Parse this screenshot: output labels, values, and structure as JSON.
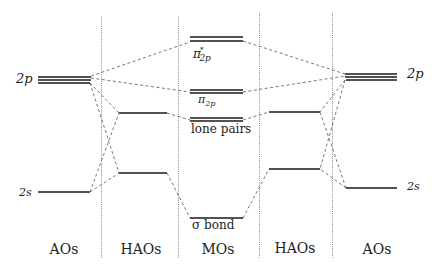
{
  "diagram": {
    "columns": [
      {
        "label": "AOs",
        "x": 64
      },
      {
        "label": "HAOs",
        "x": 141
      },
      {
        "label": "MOs",
        "x": 218
      },
      {
        "label": "HAOs",
        "x": 295
      },
      {
        "label": "AOs",
        "x": 370
      }
    ],
    "left_atom": {
      "label_2p": "2p",
      "label_2s": "2s"
    },
    "right_atom": {
      "label_2p": "2p",
      "label_2s": "2s"
    },
    "mo_levels": {
      "pi_star": {
        "symbol": "π",
        "sup": "*",
        "sub": "2p"
      },
      "pi": {
        "symbol": "π",
        "sub": "2p"
      },
      "lone_pairs": "lone pairs",
      "sigma": "σ bond"
    },
    "colors": {
      "level_line": "#1a1a1a",
      "dashed_connector": "#555555",
      "divider": "#666666"
    }
  }
}
